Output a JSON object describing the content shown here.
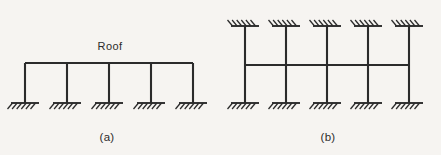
{
  "figure": {
    "background_color": "#f6f4f1",
    "line_color": "#2b2b2b",
    "width": 441,
    "height": 155
  },
  "panels": [
    {
      "id": "a",
      "caption": "(a)",
      "caption_x": 107,
      "caption_y": 141,
      "beam_label": "Roof",
      "beam_label_x": 110,
      "beam_label_y": 50,
      "beam": {
        "y": 63,
        "x_start": 25,
        "x_end": 193
      },
      "column_top_y": 63,
      "column_bottom_y": 103,
      "columns_x": [
        25,
        67,
        109,
        151,
        193
      ],
      "supports": [
        {
          "x": 25,
          "y": 103,
          "orientation": "down",
          "half_width": 14
        },
        {
          "x": 67,
          "y": 103,
          "orientation": "down",
          "half_width": 14
        },
        {
          "x": 109,
          "y": 103,
          "orientation": "down",
          "half_width": 14
        },
        {
          "x": 151,
          "y": 103,
          "orientation": "down",
          "half_width": 14
        },
        {
          "x": 193,
          "y": 103,
          "orientation": "down",
          "half_width": 14
        }
      ]
    },
    {
      "id": "b",
      "caption": "(b)",
      "caption_x": 328,
      "caption_y": 141,
      "beam_label": "",
      "beam": {
        "y": 65,
        "x_start": 245,
        "x_end": 409
      },
      "column_top_y": 26,
      "column_bottom_y": 103,
      "columns_x": [
        245,
        286,
        327,
        368,
        409
      ],
      "supports": [
        {
          "x": 245,
          "y": 26,
          "orientation": "up",
          "half_width": 14
        },
        {
          "x": 286,
          "y": 26,
          "orientation": "up",
          "half_width": 14
        },
        {
          "x": 327,
          "y": 26,
          "orientation": "up",
          "half_width": 14
        },
        {
          "x": 368,
          "y": 26,
          "orientation": "up",
          "half_width": 14
        },
        {
          "x": 409,
          "y": 26,
          "orientation": "up",
          "half_width": 14
        },
        {
          "x": 245,
          "y": 103,
          "orientation": "down",
          "half_width": 14
        },
        {
          "x": 286,
          "y": 103,
          "orientation": "down",
          "half_width": 14
        },
        {
          "x": 327,
          "y": 103,
          "orientation": "down",
          "half_width": 14
        },
        {
          "x": 368,
          "y": 103,
          "orientation": "down",
          "half_width": 14
        },
        {
          "x": 409,
          "y": 103,
          "orientation": "down",
          "half_width": 14
        }
      ]
    }
  ],
  "hatch": {
    "count": 6,
    "length": 7,
    "spacing": 4.6,
    "slant_dx": -5,
    "slant_dy": 6
  }
}
